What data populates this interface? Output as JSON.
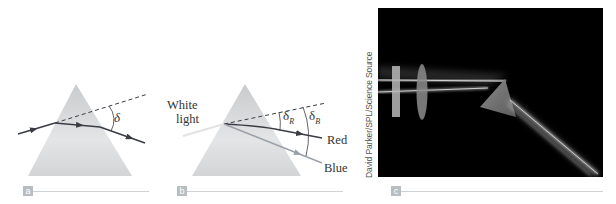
{
  "figure": {
    "panels": [
      {
        "id": "a",
        "label": "a",
        "type": "diagram",
        "symbols": {
          "deviation_angle": "δ"
        }
      },
      {
        "id": "b",
        "label": "b",
        "type": "diagram",
        "incoming_label_line1": "White",
        "incoming_label_line2": "light",
        "symbols": {
          "delta_red": "δ",
          "delta_red_sub": "R",
          "delta_blue": "δ",
          "delta_blue_sub": "B"
        },
        "outgoing_labels": {
          "red": "Red",
          "blue": "Blue"
        }
      },
      {
        "id": "c",
        "label": "c",
        "type": "photograph",
        "credit": "David Parker/SPL/Science Source"
      }
    ],
    "colors": {
      "prism_fill": "#d9dadb",
      "ray": "#3a3d44",
      "blue_ray": "#9aa1a8",
      "white_ray": "#e6e6e6",
      "label_box": "#b8bdc2",
      "rule": "#cfd3d6",
      "photo_bg": "#000000"
    }
  }
}
